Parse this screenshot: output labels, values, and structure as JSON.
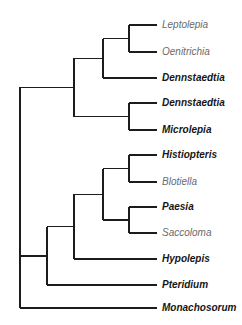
{
  "tree": {
    "name": "root",
    "children": [
      {
        "name": "n1",
        "children": [
          {
            "name": "n2",
            "children": [
              {
                "name": "n3",
                "children": [
                  {
                    "label": "Leptolepia",
                    "highlight": false
                  },
                  {
                    "label": "Oenitrichia",
                    "highlight": false
                  }
                ]
              },
              {
                "label": "Dennstaedtia",
                "highlight": true
              }
            ]
          },
          {
            "name": "n4",
            "children": [
              {
                "label": "Dennstaedtia",
                "highlight": true
              },
              {
                "label": "Microlepia",
                "highlight": true
              }
            ]
          }
        ]
      },
      {
        "name": "n5",
        "children": [
          {
            "name": "n6",
            "children": [
              {
                "name": "n7",
                "children": [
                  {
                    "name": "n8",
                    "children": [
                      {
                        "label": "Histiopteris",
                        "highlight": true
                      },
                      {
                        "label": "Blotiella",
                        "highlight": false
                      }
                    ]
                  },
                  {
                    "name": "n9",
                    "children": [
                      {
                        "label": "Paesia",
                        "highlight": true
                      },
                      {
                        "label": "Saccoloma",
                        "highlight": false
                      }
                    ]
                  }
                ]
              },
              {
                "label": "Hypolepis",
                "highlight": true
              }
            ]
          },
          {
            "label": "Pteridium",
            "highlight": true
          }
        ]
      },
      {
        "label": "Monachosorum",
        "highlight": true
      }
    ]
  },
  "colors": {
    "branch": "#1c1c1c",
    "highlight_label": "#161616",
    "normal_label": "#6a6a6a"
  }
}
